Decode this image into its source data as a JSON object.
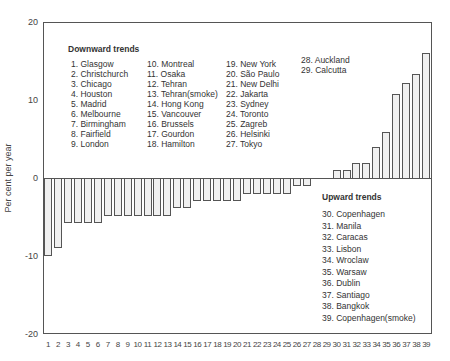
{
  "chart_data": {
    "type": "bar",
    "title": "",
    "xlabel": "",
    "ylabel": "Per cent per year",
    "ylim": [
      -20,
      20
    ],
    "yticks": [
      20,
      10,
      0,
      -10,
      -20
    ],
    "grid": false,
    "categories": [
      "1",
      "2",
      "3",
      "4",
      "5",
      "6",
      "7",
      "8",
      "9",
      "10",
      "11",
      "12",
      "13",
      "14",
      "15",
      "16",
      "17",
      "18",
      "19",
      "20",
      "21",
      "22",
      "23",
      "24",
      "25",
      "26",
      "27",
      "28",
      "29",
      "30",
      "31",
      "32",
      "33",
      "34",
      "35",
      "36",
      "37",
      "38",
      "39"
    ],
    "values": [
      -10.0,
      -9.0,
      -5.8,
      -5.8,
      -5.8,
      -5.8,
      -4.9,
      -4.9,
      -4.9,
      -4.9,
      -4.9,
      -4.9,
      -4.9,
      -3.8,
      -3.8,
      -2.9,
      -2.9,
      -2.9,
      -2.9,
      -2.9,
      -2.0,
      -2.0,
      -2.0,
      -2.0,
      -2.0,
      -1.0,
      -1.0,
      0,
      0,
      1.2,
      1.2,
      2.0,
      2.0,
      4.1,
      6.0,
      10.9,
      12.3,
      13.4,
      16.2
    ],
    "legend": {
      "downward": {
        "title": "Downward trends",
        "columns": [
          [
            "1. Glasgow",
            "2. Christchurch",
            "3. Chicago",
            "4. Houston",
            "5. Madrid",
            "6. Melbourne",
            "7. Birmingham",
            "8. Fairfield",
            "9. London"
          ],
          [
            "10. Montreal",
            "11. Osaka",
            "12. Tehran",
            "13. Tehran(smoke)",
            "14. Hong Kong",
            "15. Vancouver",
            "16. Brussels",
            "17. Gourdon",
            "18. Hamilton"
          ],
          [
            "19. New York",
            "20. São Paulo",
            "21. New Delhi",
            "22. Jakarta",
            "23. Sydney",
            "24. Toronto",
            "25. Zagreb",
            "26. Helsinki",
            "27. Tokyo"
          ],
          [
            "28. Auckland",
            "29. Calcutta"
          ]
        ]
      },
      "upward": {
        "title": "Upward trends",
        "items": [
          "30. Copenhagen",
          "31. Manila",
          "32. Caracas",
          "33. Lisbon",
          "34. Wroclaw",
          "35. Warsaw",
          "36. Dublin",
          "37. Santiago",
          "38. Bangkok",
          "39. Copenhagen(smoke)"
        ]
      }
    },
    "colors": {
      "bar_fill": "#f0f0f0",
      "bar_stroke": "#555555",
      "axis": "#555555"
    }
  }
}
